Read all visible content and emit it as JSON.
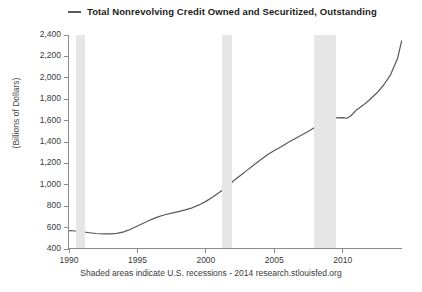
{
  "legend": {
    "label": "Total Nonrevolving Credit Owned and Securitized, Outstanding",
    "marker": "line-dash-marker",
    "color": "#595959"
  },
  "axes": {
    "ylabel": "(Billions of Dollars)",
    "yticks": [
      "400",
      "600",
      "800",
      "1,000",
      "1,200",
      "1,400",
      "1,600",
      "1,800",
      "2,000",
      "2,200",
      "2,400"
    ],
    "xticks": [
      "1990",
      "1995",
      "2000",
      "2005",
      "2010"
    ]
  },
  "footer": {
    "note": "Shaded areas indicate U.S. recessions - 2014 research.stlouisfed.org"
  },
  "chart_data": {
    "type": "line",
    "title": "Total Nonrevolving Credit Owned and Securitized, Outstanding",
    "xlabel": "",
    "ylabel": "(Billions of Dollars)",
    "xlim": [
      1990,
      2014.4
    ],
    "ylim": [
      400,
      2400
    ],
    "ytick_values": [
      400,
      600,
      800,
      1000,
      1200,
      1400,
      1600,
      1800,
      2000,
      2200,
      2400
    ],
    "xtick_values": [
      1990,
      1995,
      2000,
      2005,
      2010
    ],
    "grid": false,
    "legend_position": "top",
    "line_color": "#595959",
    "recession_color": "#e6e6e6",
    "recessions": [
      {
        "start": 1990.5,
        "end": 1991.2
      },
      {
        "start": 2001.2,
        "end": 2001.9
      },
      {
        "start": 2007.9,
        "end": 2009.5
      }
    ],
    "series": [
      {
        "name": "Total Nonrevolving Credit Owned and Securitized, Outstanding",
        "x": [
          1990.0,
          1990.5,
          1991.0,
          1991.5,
          1992.0,
          1992.5,
          1993.0,
          1993.5,
          1994.0,
          1994.5,
          1995.0,
          1995.5,
          1996.0,
          1996.5,
          1997.0,
          1997.5,
          1998.0,
          1998.5,
          1999.0,
          1999.5,
          2000.0,
          2000.5,
          2001.0,
          2001.5,
          2002.0,
          2002.5,
          2003.0,
          2003.5,
          2004.0,
          2004.5,
          2005.0,
          2005.5,
          2006.0,
          2006.5,
          2007.0,
          2007.5,
          2008.0,
          2008.5,
          2009.0,
          2009.5,
          2010.0,
          2010.3,
          2010.6,
          2011.0,
          2011.5,
          2012.0,
          2012.5,
          2013.0,
          2013.5,
          2014.0,
          2014.3
        ],
        "y": [
          572,
          568,
          560,
          552,
          545,
          542,
          541,
          546,
          560,
          585,
          615,
          645,
          675,
          700,
          720,
          736,
          750,
          765,
          785,
          812,
          845,
          885,
          930,
          975,
          1035,
          1085,
          1135,
          1185,
          1235,
          1280,
          1320,
          1355,
          1395,
          1430,
          1465,
          1500,
          1540,
          1580,
          1610,
          1625,
          1628,
          1622,
          1645,
          1700,
          1745,
          1800,
          1860,
          1935,
          2030,
          2180,
          2345
        ]
      }
    ]
  }
}
